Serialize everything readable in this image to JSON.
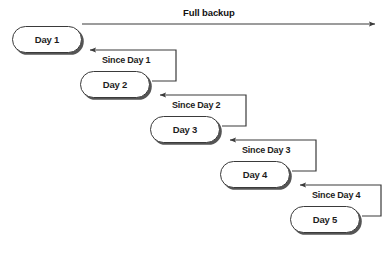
{
  "diagram": {
    "title": "Full backup",
    "background_color": "#ffffff",
    "line_color": "#3a3a3a",
    "text_color": "#1d1d1d",
    "shadow_color": "#555555",
    "nodes": [
      {
        "id": "day1",
        "label": "Day 1",
        "x": 12,
        "y": 26
      },
      {
        "id": "day2",
        "label": "Day 2",
        "x": 80,
        "y": 71
      },
      {
        "id": "day3",
        "label": "Day 3",
        "x": 150,
        "y": 116
      },
      {
        "id": "day4",
        "label": "Day 4",
        "x": 220,
        "y": 161
      },
      {
        "id": "day5",
        "label": "Day 5",
        "x": 290,
        "y": 206
      }
    ],
    "edges": [
      {
        "id": "since-day-1",
        "label": "Since Day 1",
        "from": "day2",
        "to": "day1",
        "label_x": 101,
        "label_y": 55
      },
      {
        "id": "since-day-2",
        "label": "Since Day 2",
        "from": "day3",
        "to": "day2",
        "label_x": 171,
        "label_y": 100
      },
      {
        "id": "since-day-3",
        "label": "Since Day 3",
        "from": "day4",
        "to": "day3",
        "label_x": 241,
        "label_y": 145
      },
      {
        "id": "since-day-4",
        "label": "Since Day 4",
        "from": "day5",
        "to": "day4",
        "label_x": 311,
        "label_y": 190
      }
    ],
    "full_backup_arrow": {
      "label": "Full backup",
      "label_x": 183,
      "label_y": 7,
      "start_x": 82,
      "start_y": 24,
      "end_x": 377,
      "end_y": 24
    }
  }
}
